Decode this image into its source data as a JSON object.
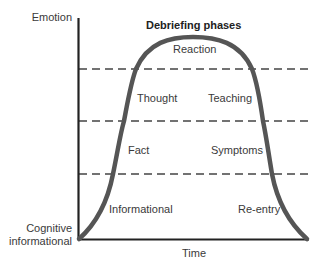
{
  "title": "Debriefing phases",
  "axes": {
    "y_top_label": "Emotion",
    "y_bottom_label_line1": "Cognitive",
    "y_bottom_label_line2": "informational",
    "x_label": "Time"
  },
  "phases": [
    {
      "name": "Reaction",
      "band": "top"
    },
    {
      "name": "Thought",
      "band": "upper",
      "side": "left"
    },
    {
      "name": "Teaching",
      "band": "upper",
      "side": "right"
    },
    {
      "name": "Fact",
      "band": "middle",
      "side": "left"
    },
    {
      "name": "Symptoms",
      "band": "middle",
      "side": "right"
    },
    {
      "name": "Informational",
      "band": "bottom",
      "side": "left"
    },
    {
      "name": "Re-entry",
      "band": "bottom",
      "side": "right"
    }
  ],
  "colors": {
    "axis": "#222222",
    "curve": "#555555",
    "dash": "#444444"
  }
}
